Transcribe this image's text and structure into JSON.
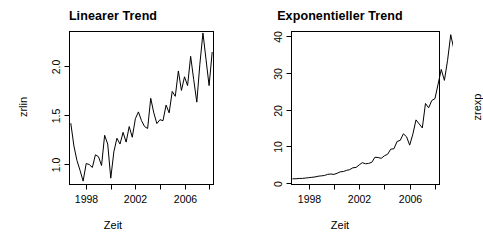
{
  "figure": {
    "background": "#ffffff",
    "foreground": "#000000",
    "width": 453,
    "height": 246,
    "panel_count": 2
  },
  "chart_data": [
    {
      "type": "line",
      "id": "linearer-trend",
      "title": "Linearer Trend",
      "xlabel": "Zeit",
      "ylabel": "zrlin",
      "grid": false,
      "legend": null,
      "xlim": [
        1996.6,
        2008.4
      ],
      "ylim": [
        0.78,
        2.36
      ],
      "xticks": [
        1998,
        2000,
        2002,
        2004,
        2006,
        2008
      ],
      "xticklabels": [
        "1998",
        "",
        "2002",
        "",
        "2006",
        ""
      ],
      "yticks": [
        1.0,
        1.5,
        2.0
      ],
      "yticklabels": [
        "1.0",
        "1.5",
        "2.0"
      ],
      "line_color": "#000000",
      "x": [
        1996.75,
        1997.0,
        1997.25,
        1997.5,
        1997.75,
        1998.0,
        1998.25,
        1998.5,
        1998.75,
        1999.0,
        1999.25,
        1999.5,
        1999.75,
        2000.0,
        2000.25,
        2000.5,
        2000.75,
        2001.0,
        2001.25,
        2001.5,
        2001.75,
        2002.0,
        2002.25,
        2002.5,
        2002.75,
        2003.0,
        2003.25,
        2003.5,
        2003.75,
        2004.0,
        2004.25,
        2004.5,
        2004.75,
        2005.0,
        2005.25,
        2005.5,
        2005.75,
        2006.0,
        2006.25,
        2006.5,
        2006.75,
        2007.0,
        2007.25,
        2007.5,
        2007.75,
        2008.0,
        2008.25
      ],
      "values": [
        1.41,
        1.18,
        1.03,
        0.93,
        0.82,
        1.0,
        0.99,
        0.96,
        1.09,
        1.07,
        0.98,
        1.29,
        1.2,
        0.85,
        1.12,
        1.26,
        1.2,
        1.32,
        1.22,
        1.38,
        1.27,
        1.46,
        1.53,
        1.44,
        1.38,
        1.36,
        1.67,
        1.52,
        1.41,
        1.45,
        1.44,
        1.6,
        1.52,
        1.74,
        1.69,
        1.95,
        1.75,
        1.89,
        1.8,
        2.1,
        1.86,
        1.63,
        2.02,
        2.34,
        2.07,
        1.8,
        2.14
      ]
    },
    {
      "type": "line",
      "id": "exponentieller-trend",
      "title": "Exponentieller Trend",
      "xlabel": "Zeit",
      "ylabel": "zrexp",
      "grid": false,
      "legend": null,
      "xlim": [
        1996.6,
        2008.4
      ],
      "ylim": [
        -0.6,
        41.5
      ],
      "xticks": [
        1998,
        2000,
        2002,
        2004,
        2006,
        2008
      ],
      "xticklabels": [
        "1998",
        "",
        "2002",
        "",
        "2006",
        ""
      ],
      "yticks": [
        0,
        10,
        20,
        30,
        40
      ],
      "yticklabels": [
        "0",
        "10",
        "20",
        "30",
        "40"
      ],
      "line_color": "#000000",
      "x": [
        1996.75,
        1997.0,
        1997.25,
        1997.5,
        1997.75,
        1998.0,
        1998.25,
        1998.5,
        1998.75,
        1999.0,
        1999.25,
        1999.5,
        1999.75,
        2000.0,
        2000.25,
        2000.5,
        2000.75,
        2001.0,
        2001.25,
        2001.5,
        2001.75,
        2002.0,
        2002.25,
        2002.5,
        2002.75,
        2003.0,
        2003.25,
        2003.5,
        2003.75,
        2004.0,
        2004.25,
        2004.5,
        2004.75,
        2005.0,
        2005.25,
        2005.5,
        2005.75,
        2006.0,
        2006.25,
        2006.5,
        2006.75,
        2007.0,
        2007.25,
        2007.5,
        2007.75,
        2008.0,
        2008.25
      ],
      "values": [
        1.1,
        1.1,
        1.2,
        1.2,
        1.3,
        1.4,
        1.5,
        1.6,
        1.8,
        1.9,
        2.0,
        2.3,
        2.4,
        2.3,
        2.6,
        3.0,
        3.1,
        3.4,
        3.6,
        4.1,
        4.2,
        4.9,
        5.5,
        5.2,
        5.3,
        5.6,
        7.0,
        6.9,
        6.7,
        7.4,
        7.8,
        9.2,
        9.3,
        11.3,
        11.6,
        13.4,
        12.6,
        10.3,
        13.3,
        17.2,
        16.1,
        15.0,
        21.7,
        20.5,
        22.5,
        23.0,
        27.0
      ],
      "values_tail": [
        31.0,
        28.0,
        33.5,
        40.5,
        36.5,
        39.0,
        38.5
      ]
    }
  ]
}
